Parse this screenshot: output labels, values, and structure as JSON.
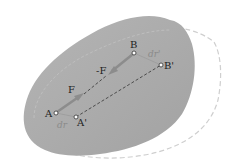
{
  "colors": {
    "body_fill": "#a9a9a9",
    "body_fill_light": "#b8b8b8",
    "dashed_outline": "#c8c8c8",
    "force_arrow": "#8c8c8c",
    "point_stroke": "#333333"
  },
  "points": {
    "A": {
      "label": "A"
    },
    "A_prime": {
      "label": "A'"
    },
    "B": {
      "label": "B"
    },
    "B_prime": {
      "label": "B'"
    }
  },
  "forces": {
    "F": {
      "label": "F"
    },
    "minus_F": {
      "label": "-F"
    }
  },
  "displacements": {
    "dr_A": {
      "label": "dr"
    },
    "dr_B": {
      "label": "dr'"
    }
  }
}
